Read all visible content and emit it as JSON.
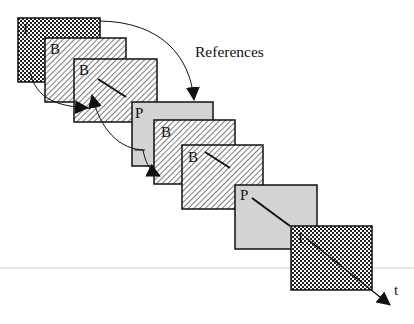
{
  "diagram": {
    "references_label": "References",
    "time_axis_label": "t",
    "colors": {
      "stroke": "#111111",
      "p_fill": "#d3d3d3",
      "background": "#ffffff",
      "rule": "#e6e6e6"
    },
    "frames": [
      {
        "type": "I",
        "label": "I",
        "fill": "crosshatch",
        "x": 18,
        "y": 18,
        "w": 82,
        "h": 64
      },
      {
        "type": "B",
        "label": "B",
        "fill": "diagonal",
        "x": 45,
        "y": 38,
        "w": 81,
        "h": 64
      },
      {
        "type": "B",
        "label": "B",
        "fill": "diagonal",
        "x": 74,
        "y": 59,
        "w": 83,
        "h": 63
      },
      {
        "type": "P",
        "label": "P",
        "fill": "gray",
        "x": 132,
        "y": 102,
        "w": 81,
        "h": 64
      },
      {
        "type": "B",
        "label": "B",
        "fill": "diagonal",
        "x": 154,
        "y": 120,
        "w": 81,
        "h": 64
      },
      {
        "type": "B",
        "label": "B",
        "fill": "diagonal",
        "x": 182,
        "y": 145,
        "w": 81,
        "h": 64
      },
      {
        "type": "P",
        "label": "P",
        "fill": "gray",
        "x": 235,
        "y": 185,
        "w": 82,
        "h": 64
      },
      {
        "type": "I",
        "label": "I",
        "fill": "crosshatch",
        "x": 291,
        "y": 226,
        "w": 81,
        "h": 64
      }
    ]
  }
}
